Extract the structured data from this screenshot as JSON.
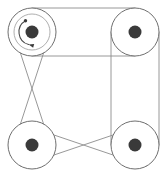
{
  "diagram": {
    "canvas": {
      "width": 168,
      "height": 177,
      "background": "#ffffff"
    },
    "colors": {
      "belt": "#8c8c8c",
      "pulley_rim": "#6f6f6f",
      "pulley_inner": "#9a9a9a",
      "hub": "#3a3a3a",
      "rotation_arrow": "#4a4a4a",
      "background": "#ffffff"
    },
    "pulleys": [
      {
        "id": "top-left",
        "label": "A",
        "cx": 32,
        "cy": 32,
        "radius": 24,
        "inner_radius": 18,
        "hub_radius": 6.5,
        "has_rotation_arrow": true,
        "rotation_direction": "counterclockwise"
      },
      {
        "id": "top-right",
        "label": "B",
        "cx": 135,
        "cy": 32,
        "radius": 24,
        "inner_radius": 0,
        "hub_radius": 6.5,
        "has_rotation_arrow": false,
        "rotation_direction": ""
      },
      {
        "id": "bottom-left",
        "label": "C",
        "cx": 32,
        "cy": 145,
        "radius": 24,
        "inner_radius": 0,
        "hub_radius": 6.5,
        "has_rotation_arrow": false,
        "rotation_direction": ""
      },
      {
        "id": "bottom-right",
        "label": "D",
        "cx": 135,
        "cy": 145,
        "radius": 24,
        "inner_radius": 0,
        "hub_radius": 6.5,
        "has_rotation_arrow": false,
        "rotation_direction": ""
      }
    ],
    "belts": [
      {
        "id": "top-belt",
        "type": "open",
        "from": "top-left",
        "to": "top-right",
        "side": "top",
        "description": "Open belt, two parallel tangent lines across the top"
      },
      {
        "id": "right-belt",
        "type": "open",
        "from": "top-right",
        "to": "bottom-right",
        "side": "right",
        "description": "Open belt, two parallel tangent lines down the right"
      },
      {
        "id": "left-belt",
        "type": "crossed",
        "from": "top-left",
        "to": "bottom-left",
        "side": "left",
        "description": "Crossed belt, tangent lines intersect midway on the left"
      },
      {
        "id": "bottom-belt",
        "type": "crossed",
        "from": "bottom-left",
        "to": "bottom-right",
        "side": "bottom",
        "description": "Crossed belt, tangent lines intersect midway along the bottom"
      }
    ],
    "rotation_arrow": {
      "pulley": "top-left",
      "arc_radius": 13,
      "start_angle_deg": 120,
      "end_angle_deg": 255,
      "direction": "counterclockwise"
    }
  }
}
